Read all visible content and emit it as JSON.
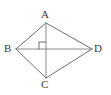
{
  "figure": {
    "kind": "geometry-diagram",
    "shape_name": "rhombus",
    "background_color": "#ffffff",
    "stroke_color": "#6e6e6e",
    "label_color": "#3d3d3d",
    "stroke_width": 1,
    "canvas": {
      "width": 111,
      "height": 95
    },
    "vertices": [
      {
        "id": "A",
        "label": "A",
        "x": 46,
        "y": 23,
        "position": "top"
      },
      {
        "id": "B",
        "label": "B",
        "x": 16,
        "y": 49,
        "position": "left"
      },
      {
        "id": "C",
        "label": "C",
        "x": 46,
        "y": 78,
        "position": "bottom"
      },
      {
        "id": "D",
        "label": "D",
        "x": 92,
        "y": 49,
        "position": "right"
      }
    ],
    "sides": [
      {
        "from": "A",
        "to": "B"
      },
      {
        "from": "B",
        "to": "C"
      },
      {
        "from": "C",
        "to": "D"
      },
      {
        "from": "D",
        "to": "A"
      }
    ],
    "diagonals": [
      {
        "from": "A",
        "to": "C",
        "orientation": "vertical"
      },
      {
        "from": "B",
        "to": "D",
        "orientation": "horizontal"
      }
    ],
    "intersection": {
      "x": 46,
      "y": 49
    },
    "right_angle_marker": {
      "present": true,
      "quadrant": "upper-left",
      "size": 7,
      "x": 39,
      "y": 42
    }
  }
}
